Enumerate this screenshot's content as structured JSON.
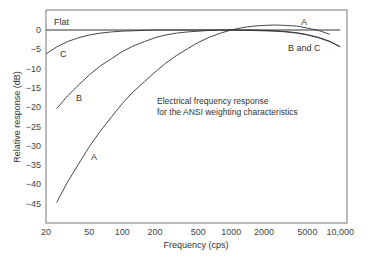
{
  "chart_data": {
    "type": "line",
    "title": "",
    "annotation": [
      "Electrical frequency response",
      "for the ANSI weighting characteristics"
    ],
    "xlabel": "Frequency (cps)",
    "ylabel": "Relative response (dB)",
    "xscale": "log",
    "xlim": [
      20,
      10000
    ],
    "ylim": [
      -50,
      5
    ],
    "grid": false,
    "x_ticks": [
      "20",
      "50",
      "100",
      "200",
      "500",
      "1000",
      "2000",
      "5000",
      "10,000"
    ],
    "x_tick_values": [
      20,
      50,
      100,
      200,
      500,
      1000,
      2000,
      5000,
      10000
    ],
    "y_ticks": [
      "0",
      "-5",
      "-10",
      "-15",
      "-20",
      "-25",
      "-30",
      "-35",
      "-40",
      "-45"
    ],
    "y_tick_values": [
      0,
      -5,
      -10,
      -15,
      -20,
      -25,
      -30,
      -35,
      -40,
      -45
    ],
    "series": [
      {
        "name": "Flat",
        "x": [
          20,
          10000
        ],
        "values": [
          0,
          0
        ]
      },
      {
        "name": "A",
        "x": [
          25,
          31.5,
          40,
          50,
          63,
          80,
          100,
          125,
          160,
          200,
          250,
          315,
          400,
          500,
          630,
          800,
          1000,
          1250,
          1600,
          2000,
          2500,
          3150,
          4000,
          5000,
          6300,
          8000
        ],
        "values": [
          -44.7,
          -39.4,
          -34.6,
          -30.2,
          -26.2,
          -22.5,
          -19.1,
          -16.1,
          -13.4,
          -10.9,
          -8.6,
          -6.6,
          -4.8,
          -3.2,
          -1.9,
          -0.8,
          0,
          0.6,
          1.0,
          1.2,
          1.3,
          1.2,
          1.0,
          0.5,
          -0.1,
          -1.1
        ]
      },
      {
        "name": "B",
        "x": [
          25,
          31.5,
          40,
          50,
          63,
          80,
          100,
          125,
          160,
          200,
          250,
          315,
          400,
          500,
          630,
          800,
          1000,
          1250,
          1600,
          2000,
          2500,
          3150,
          4000,
          5000,
          6300,
          8000,
          10000
        ],
        "values": [
          -20.4,
          -17.1,
          -14.2,
          -11.6,
          -9.3,
          -7.4,
          -5.6,
          -4.2,
          -3.0,
          -2.0,
          -1.3,
          -0.8,
          -0.5,
          -0.3,
          -0.1,
          0,
          0,
          0,
          0,
          -0.1,
          -0.2,
          -0.4,
          -0.7,
          -1.2,
          -1.9,
          -2.9,
          -4.3
        ]
      },
      {
        "name": "C",
        "x": [
          20,
          25,
          31.5,
          40,
          50,
          63,
          80,
          100,
          125,
          160,
          200,
          500,
          1000,
          2000,
          2500,
          3150,
          4000,
          5000,
          6300,
          8000,
          10000
        ],
        "values": [
          -6.2,
          -4.4,
          -3.0,
          -2.0,
          -1.3,
          -0.8,
          -0.5,
          -0.3,
          -0.2,
          -0.1,
          0,
          0,
          0,
          -0.2,
          -0.3,
          -0.5,
          -0.8,
          -1.3,
          -2.0,
          -3.0,
          -4.4
        ]
      }
    ],
    "curve_labels": {
      "flat": "Flat",
      "a_high": "A",
      "bc_high": "B and C",
      "c_low": "C",
      "b_low": "B",
      "a_low": "A"
    },
    "legend": "none (inline curve labels)"
  }
}
